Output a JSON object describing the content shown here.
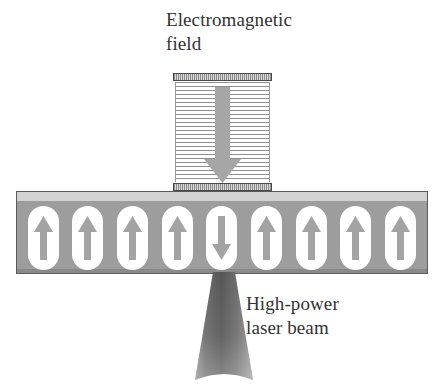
{
  "figure": {
    "background_color": "#ffffff"
  },
  "labels": {
    "field": "Electromagnetic\nfield",
    "laser": "High-power\nlaser beam"
  },
  "field_source": {
    "name": "electromagnetic-field-coil",
    "arrow_direction": "down",
    "arrow_color": "#a6a6a6",
    "hatch_color": "#8f8f8f",
    "cap_border_color": "#4a4a4a",
    "stripe_count": 25
  },
  "medium": {
    "name": "magnetic-recording-layer",
    "slab_color": "#9d9d9d",
    "highlight_color": "#d2d2d2",
    "border_color": "#5b5b5b",
    "domain_fill": "#ffffff",
    "domain_arrow_color": "#a3a3a3",
    "domain_count": 9,
    "reversed_index": 4,
    "domains": [
      {
        "index": 0,
        "direction": "up"
      },
      {
        "index": 1,
        "direction": "up"
      },
      {
        "index": 2,
        "direction": "up"
      },
      {
        "index": 3,
        "direction": "up"
      },
      {
        "index": 4,
        "direction": "down"
      },
      {
        "index": 5,
        "direction": "up"
      },
      {
        "index": 6,
        "direction": "up"
      },
      {
        "index": 7,
        "direction": "up"
      },
      {
        "index": 8,
        "direction": "up"
      }
    ]
  },
  "laser": {
    "name": "high-power-laser-beam",
    "shape": "downward-widening-cone",
    "color_top": "#5e5e5e",
    "color_bottom": "#9c9c9c"
  }
}
